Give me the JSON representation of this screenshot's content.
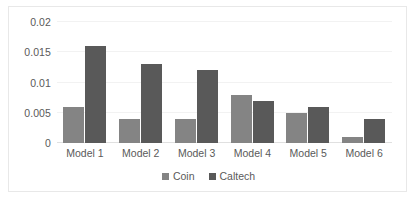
{
  "chart_data": {
    "type": "bar",
    "title": "",
    "subtitle": "",
    "xlabel": "",
    "ylabel": "",
    "categories": [
      "Model 1",
      "Model 2",
      "Model 3",
      "Model 4",
      "Model 5",
      "Model 6"
    ],
    "series": [
      {
        "name": "Coin",
        "color": "#848484",
        "values": [
          0.006,
          0.004,
          0.004,
          0.008,
          0.005,
          0.001
        ]
      },
      {
        "name": "Caltech",
        "color": "#595959",
        "values": [
          0.016,
          0.013,
          0.012,
          0.007,
          0.006,
          0.004
        ]
      }
    ],
    "ylim": [
      0,
      0.02
    ],
    "yticks": [
      0,
      0.005,
      0.01,
      0.015,
      0.02
    ],
    "ytick_labels": [
      "0",
      "0.005",
      "0.01",
      "0.015",
      "0.02"
    ],
    "grid": true,
    "grid_axis": "y",
    "legend": true,
    "legend_position": "bottom",
    "gridline_color": "#f2f2f2",
    "border_color": "#e8e8e8",
    "background_color": "#ffffff",
    "text_color": "#5a5a5a"
  }
}
